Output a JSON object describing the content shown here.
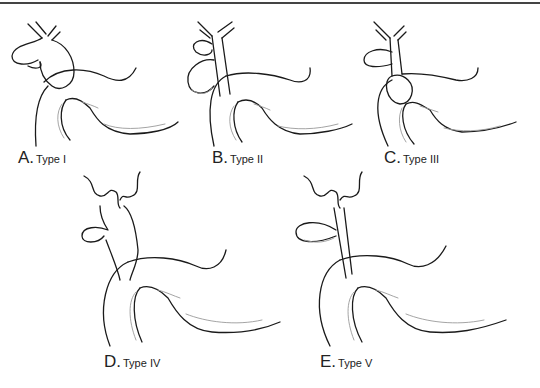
{
  "figure": {
    "panels": [
      {
        "id": "A",
        "letter": "A.",
        "type_label": "Type I"
      },
      {
        "id": "B",
        "letter": "B.",
        "type_label": "Type II"
      },
      {
        "id": "C",
        "letter": "C.",
        "type_label": "Type III"
      },
      {
        "id": "D",
        "letter": "D.",
        "type_label": "Type IV"
      },
      {
        "id": "E",
        "letter": "E.",
        "type_label": "Type V"
      }
    ]
  }
}
